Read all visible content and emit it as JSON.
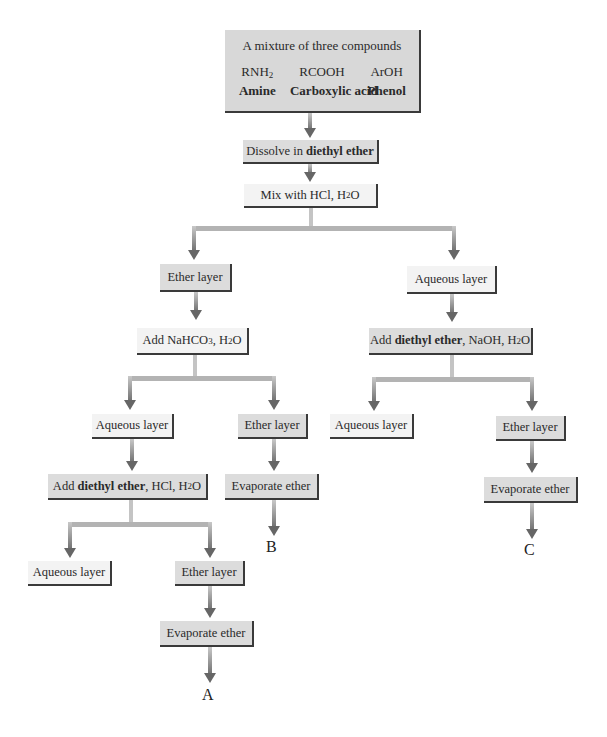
{
  "diagram": {
    "title": "A mixture of three compounds",
    "compounds": [
      {
        "formula": "RNH",
        "sub": "2",
        "name": "Amine"
      },
      {
        "formula": "RCOOH",
        "sub": "",
        "name": "Carboxylic acid"
      },
      {
        "formula": "ArOH",
        "sub": "",
        "name": "Phenol"
      }
    ],
    "steps": {
      "dissolve": {
        "pre": "Dissolve in ",
        "bold": "diethyl ether",
        "post": ""
      },
      "mix_hcl": {
        "pre": "Mix with HCl, H",
        "sub": "2",
        "post": "O"
      },
      "ether_layer_1": "Ether layer",
      "aqueous_layer_1": "Aqueous layer",
      "add_nahco3": {
        "pre": "Add NaHCO",
        "sub1": "3",
        "mid": ", H",
        "sub2": "2",
        "post": "O"
      },
      "add_ether_naoh": {
        "pre": "Add ",
        "bold": "diethyl ether",
        "mid": ", NaOH, H",
        "sub": "2",
        "post": "O"
      },
      "aqueous_layer_2": "Aqueous layer",
      "ether_layer_2": "Ether layer",
      "evaporate_b": "Evaporate ether",
      "aqueous_layer_3": "Aqueous layer",
      "ether_layer_3": "Ether layer",
      "evaporate_c": "Evaporate ether",
      "add_ether_hcl": {
        "pre": "Add ",
        "bold": "diethyl ether",
        "mid": ", HCl, H",
        "sub": "2",
        "post": "O"
      },
      "aqueous_layer_4": "Aqueous layer",
      "ether_layer_4": "Ether layer",
      "evaporate_a": "Evaporate ether"
    },
    "products": {
      "a": "A",
      "b": "B",
      "c": "C"
    }
  }
}
